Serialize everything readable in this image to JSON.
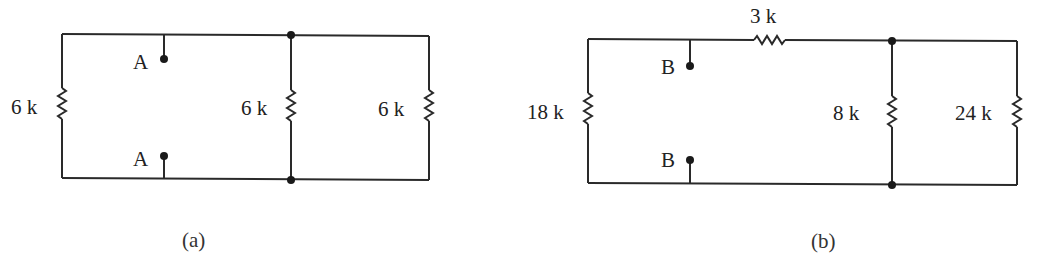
{
  "figure": {
    "circuits": [
      {
        "id": "a",
        "caption": "(a)",
        "terminal_label": "A",
        "resistors": [
          {
            "name": "left",
            "label": "6 k",
            "orientation": "vertical"
          },
          {
            "name": "middle",
            "label": "6 k",
            "orientation": "vertical"
          },
          {
            "name": "right",
            "label": "6 k",
            "orientation": "vertical"
          }
        ],
        "terminals": [
          "A",
          "A"
        ]
      },
      {
        "id": "b",
        "caption": "(b)",
        "terminal_label": "B",
        "resistors": [
          {
            "name": "top-series",
            "label": "3 k",
            "orientation": "horizontal"
          },
          {
            "name": "left",
            "label": "18 k",
            "orientation": "vertical"
          },
          {
            "name": "middle",
            "label": "8 k",
            "orientation": "vertical"
          },
          {
            "name": "right",
            "label": "24 k",
            "orientation": "vertical"
          }
        ],
        "terminals": [
          "B",
          "B"
        ]
      }
    ],
    "colors": {
      "line": "#2a2a2a",
      "text": "#222222",
      "background": "#ffffff"
    }
  }
}
